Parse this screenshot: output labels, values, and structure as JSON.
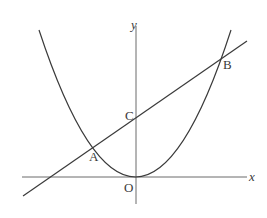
{
  "figure": {
    "type": "parabola-line-intersection",
    "axes": {
      "x_label": "x",
      "y_label": "y",
      "origin_label": "O"
    },
    "points": [
      {
        "label": "A",
        "role": "left intersection of parabola and line"
      },
      {
        "label": "B",
        "role": "right intersection of parabola and line"
      },
      {
        "label": "C",
        "role": "intersection of line and y-axis"
      },
      {
        "label": "O",
        "role": "origin / vertex of parabola"
      }
    ],
    "colors": {
      "stroke": "#3a3a3a",
      "background": "#ffffff"
    }
  },
  "labels": {
    "x": "x",
    "y": "y",
    "O": "O",
    "A": "A",
    "B": "B",
    "C": "C"
  }
}
